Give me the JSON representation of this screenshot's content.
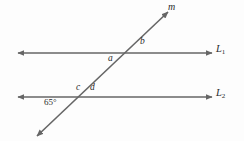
{
  "figure": {
    "background_color": "#fdfdfd",
    "stroke_color": "#666666",
    "text_color": "#2b2b2b",
    "lines": {
      "l1": {
        "name": "L",
        "subscript": "1",
        "label": "L1",
        "y": 53,
        "x_start": 18,
        "x_end": 212,
        "arrows": "both"
      },
      "l2": {
        "name": "L",
        "subscript": "2",
        "label": "L2",
        "y": 97,
        "x_start": 18,
        "x_end": 212,
        "arrows": "both"
      },
      "transversal": {
        "name": "m",
        "x_start": 37,
        "y_start": 136,
        "x_end": 168,
        "y_end": 12,
        "arrows": "both"
      }
    },
    "angles": {
      "a": "a",
      "b": "b",
      "c": "c",
      "d": "d",
      "known_measure": "65°"
    }
  }
}
